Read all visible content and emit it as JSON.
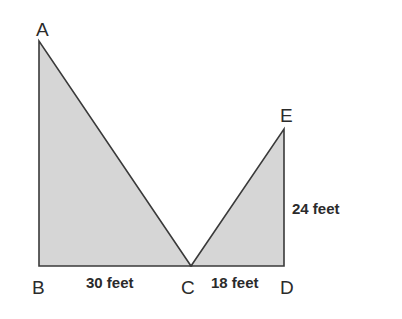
{
  "diagram": {
    "colors": {
      "fill": "#d6d6d6",
      "stroke": "#3a3a3a",
      "background": "#ffffff"
    },
    "vertices": {
      "A": {
        "label": "A"
      },
      "B": {
        "label": "B"
      },
      "C": {
        "label": "C"
      },
      "D": {
        "label": "D"
      },
      "E": {
        "label": "E"
      }
    },
    "triangles": [
      {
        "name": "ABC",
        "vertices": [
          "A",
          "B",
          "C"
        ],
        "right_angle_at": "B"
      },
      {
        "name": "EDC",
        "vertices": [
          "E",
          "D",
          "C"
        ],
        "right_angle_at": "D"
      }
    ],
    "measurements": {
      "BC": "30 feet",
      "CD": "18 feet",
      "DE": "24 feet"
    }
  }
}
